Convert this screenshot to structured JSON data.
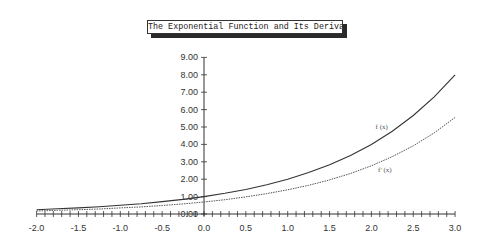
{
  "chart_data": {
    "type": "line",
    "title": "The Exponential Function and Its Derivative",
    "xlabel": "",
    "ylabel": "",
    "xlim": [
      -2.0,
      3.0
    ],
    "ylim": [
      0.0,
      9.0
    ],
    "grid": false,
    "legend": "inline labels near curves",
    "x_ticks": [
      "-2.0",
      "-1.5",
      "-1.0",
      "-0.5",
      "0.0",
      "0.5",
      "1.0",
      "1.5",
      "2.0",
      "2.5",
      "3.0"
    ],
    "y_ticks": [
      "0.00",
      "1.00",
      "2.00",
      "3.00",
      "4.00",
      "5.00",
      "6.00",
      "7.00",
      "8.00",
      "9.00"
    ],
    "x": [
      -2.0,
      -1.75,
      -1.5,
      -1.25,
      -1.0,
      -0.75,
      -0.5,
      -0.25,
      0.0,
      0.25,
      0.5,
      0.75,
      1.0,
      1.25,
      1.5,
      1.75,
      2.0,
      2.25,
      2.5,
      2.75,
      3.0
    ],
    "series": [
      {
        "name": "f (x)",
        "style": "solid",
        "values": [
          0.25,
          0.3,
          0.35,
          0.42,
          0.5,
          0.59,
          0.71,
          0.84,
          1.0,
          1.19,
          1.41,
          1.68,
          2.0,
          2.38,
          2.83,
          3.36,
          4.0,
          4.76,
          5.66,
          6.73,
          8.0
        ]
      },
      {
        "name": "f' (x)",
        "style": "dotted",
        "values": [
          0.17,
          0.21,
          0.25,
          0.29,
          0.35,
          0.41,
          0.49,
          0.58,
          0.69,
          0.82,
          0.98,
          1.17,
          1.39,
          1.65,
          1.96,
          2.33,
          2.77,
          3.3,
          3.92,
          4.66,
          5.55
        ]
      }
    ],
    "annotations": [
      {
        "text": "f (x)",
        "x": 2.05,
        "y": 4.9
      },
      {
        "text": "f' (x)",
        "x": 2.08,
        "y": 2.4
      }
    ]
  },
  "title": "The Exponential Function and Its Derivative"
}
